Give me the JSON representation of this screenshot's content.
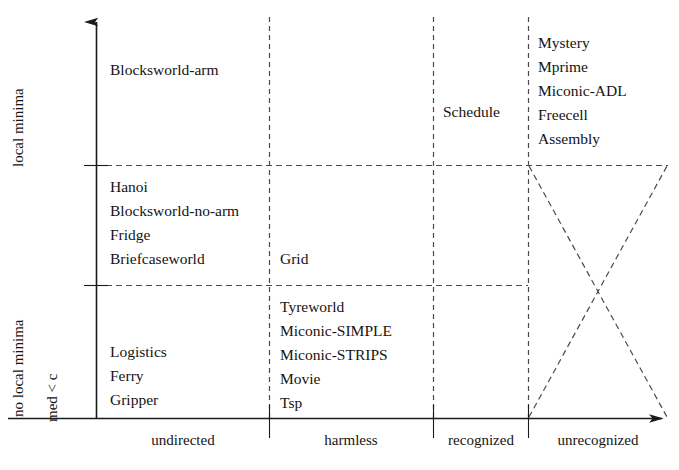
{
  "chart_data": {
    "type": "table",
    "title": "",
    "xlabel": "",
    "ylabel": "",
    "grid": true,
    "legend": "none",
    "x_axis": {
      "categories": [
        "undirected",
        "harmless",
        "recognized",
        "unrecognized"
      ],
      "arrow": true
    },
    "y_axis": {
      "categories": [
        "med < c",
        "no local minima",
        "local minima"
      ],
      "arrow": true
    },
    "cells": [
      {
        "row": "local minima",
        "column": "undirected",
        "entries": [
          "Blocksworld-arm"
        ]
      },
      {
        "row": "local minima",
        "column": "harmless",
        "entries": []
      },
      {
        "row": "local minima",
        "column": "recognized",
        "entries": [
          "Schedule"
        ]
      },
      {
        "row": "local minima",
        "column": "unrecognized",
        "entries": [
          "Mystery",
          "Mprime",
          "Miconic-ADL",
          "Freecell",
          "Assembly"
        ]
      },
      {
        "row": "no local minima",
        "column": "undirected",
        "entries": [
          "Hanoi",
          "Blocksworld-no-arm",
          "Fridge",
          "Briefcaseworld"
        ]
      },
      {
        "row": "no local minima",
        "column": "harmless",
        "entries": [
          "Grid"
        ]
      },
      {
        "row": "no local minima",
        "column": "recognized",
        "entries": []
      },
      {
        "row": "no local minima",
        "column": "unrecognized",
        "entries": []
      },
      {
        "row": "med < c",
        "column": "undirected",
        "entries": [
          "Logistics",
          "Ferry",
          "Gripper"
        ]
      },
      {
        "row": "med < c",
        "column": "harmless",
        "entries": [
          "Tyreworld",
          "Miconic-SIMPLE",
          "Miconic-STRIPS",
          "Movie",
          "Tsp"
        ]
      },
      {
        "row": "med < c",
        "column": "recognized",
        "entries": []
      },
      {
        "row": "med < c",
        "column": "unrecognized",
        "entries": []
      }
    ],
    "annotations": [
      {
        "name": "crossed-out-region",
        "description": "dashed X crossing the unrecognized column below the local-minima line"
      }
    ]
  },
  "axis": {
    "x_ticks": [
      {
        "label": "undirected"
      },
      {
        "label": "harmless"
      },
      {
        "label": "recognized"
      },
      {
        "label": "unrecognized"
      }
    ],
    "y_ticks": [
      {
        "label": "local minima"
      },
      {
        "label": "no local minima"
      },
      {
        "label": "med < c"
      }
    ]
  },
  "cell_text": {
    "r1c1": [
      "Blocksworld-arm"
    ],
    "r1c3": [
      "Schedule"
    ],
    "r1c4": [
      "Mystery",
      "Mprime",
      "Miconic-ADL",
      "Freecell",
      "Assembly"
    ],
    "r2c1": [
      "Hanoi",
      "Blocksworld-no-arm",
      "Fridge",
      "Briefcaseworld"
    ],
    "r2c2": [
      "Grid"
    ],
    "r3c1": [
      "Logistics",
      "Ferry",
      "Gripper"
    ],
    "r3c2": [
      "Tyreworld",
      "Miconic-SIMPLE",
      "Miconic-STRIPS",
      "Movie",
      "Tsp"
    ]
  },
  "colors": {
    "axis": "#1a1a1a",
    "grid": "#555555",
    "text": "#141414",
    "background": "#ffffff"
  }
}
